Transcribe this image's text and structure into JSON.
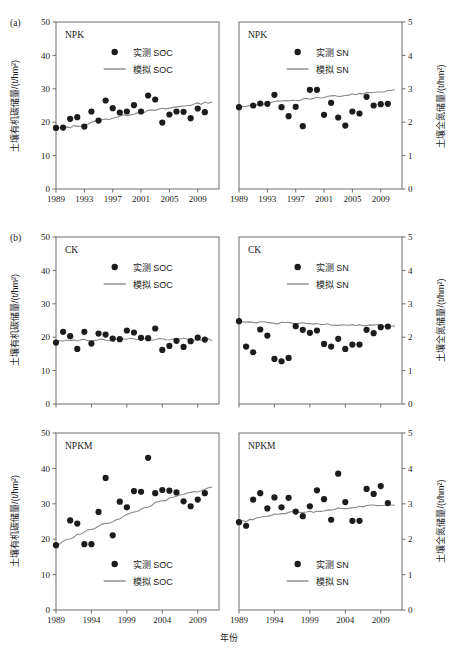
{
  "figure": {
    "corner_tags": [
      "(a)",
      "(b)"
    ],
    "xlabel": "年份",
    "ylabel_left": "土壤有机碳储量/(t/hm²)",
    "ylabel_right": "土壤全氮储量/(t/hm²)",
    "legend_measured_soc": "实测 SOC",
    "legend_simulated_soc": "模拟 SOC",
    "legend_measured_sn": "实测 SN",
    "legend_simulated_sn": "模拟 SN",
    "marker_color": "#1c1c1c",
    "line_color": "#8a8a8a",
    "axis_color": "#6d6d6d"
  },
  "chart_data": [
    {
      "type": "scatter",
      "panel": "a-left",
      "title": "NPK",
      "xlabel": "年份",
      "ylabel": "土壤有机碳储量/(t/hm²)",
      "xlim": [
        1989,
        2012
      ],
      "ylim": [
        0,
        50
      ],
      "yticks": [
        0,
        10,
        20,
        30,
        40,
        50
      ],
      "xticks": [
        1989,
        1993,
        1997,
        2001,
        2005,
        2009
      ],
      "grid": false,
      "legend_position": "top-center",
      "series": [
        {
          "name": "实测 SOC",
          "type": "scatter",
          "x": [
            1989,
            1990,
            1991,
            1992,
            1993,
            1994,
            1995,
            1996,
            1997,
            1998,
            1999,
            2000,
            2001,
            2002,
            2003,
            2004,
            2005,
            2006,
            2007,
            2008,
            2009,
            2010
          ],
          "values": [
            18.3,
            18.4,
            21.0,
            21.5,
            18.7,
            23.2,
            20.5,
            26.5,
            24.2,
            22.9,
            23.2,
            25.1,
            23.2,
            28.0,
            26.8,
            19.9,
            22.3,
            23.2,
            23.1,
            21.2,
            24.1,
            23.0
          ]
        },
        {
          "name": "模拟 SOC",
          "type": "line",
          "x": [
            1989,
            1991,
            1993,
            1995,
            1997,
            1999,
            2001,
            2003,
            2005,
            2007,
            2009,
            2011
          ],
          "values": [
            18.2,
            18.6,
            19.2,
            20.4,
            21.3,
            22.2,
            23.0,
            23.6,
            24.2,
            24.9,
            25.5,
            26.1
          ]
        }
      ]
    },
    {
      "type": "scatter",
      "panel": "a-right",
      "title": "NPK",
      "xlabel": "年份",
      "ylabel": "土壤全氮储量/(t/hm²)",
      "xlim": [
        1989,
        2012
      ],
      "ylim": [
        0,
        5
      ],
      "yticks": [
        0,
        1,
        2,
        3,
        4,
        5
      ],
      "xticks": [
        1989,
        1993,
        1997,
        2001,
        2005,
        2009
      ],
      "grid": false,
      "legend_position": "top-center",
      "series": [
        {
          "name": "实测 SN",
          "type": "scatter",
          "x": [
            1989,
            1991,
            1992,
            1993,
            1994,
            1995,
            1996,
            1997,
            1998,
            1999,
            2000,
            2001,
            2002,
            2003,
            2004,
            2005,
            2006,
            2007,
            2008,
            2009,
            2010
          ],
          "values": [
            2.45,
            2.5,
            2.56,
            2.55,
            2.82,
            2.45,
            2.18,
            2.46,
            1.88,
            2.97,
            2.97,
            2.22,
            2.58,
            2.14,
            1.9,
            2.32,
            2.26,
            2.76,
            2.5,
            2.54,
            2.55
          ]
        },
        {
          "name": "模拟 SN",
          "type": "line",
          "x": [
            1989,
            1991,
            1993,
            1995,
            1997,
            1999,
            2001,
            2003,
            2005,
            2007,
            2009,
            2011
          ],
          "values": [
            2.48,
            2.5,
            2.56,
            2.62,
            2.66,
            2.7,
            2.74,
            2.78,
            2.83,
            2.88,
            2.92,
            2.96
          ]
        }
      ]
    },
    {
      "type": "scatter",
      "panel": "b-top-left",
      "title": "CK",
      "xlabel": "年份",
      "ylabel": "土壤有机碳储量/(t/hm²)",
      "xlim": [
        1989,
        2012
      ],
      "ylim": [
        0,
        50
      ],
      "yticks": [
        0,
        10,
        20,
        30,
        40,
        50
      ],
      "xticks": [
        1989,
        1994,
        1999,
        2004,
        2009
      ],
      "grid": false,
      "legend_position": "top-center",
      "series": [
        {
          "name": "实测 SOC",
          "type": "scatter",
          "x": [
            1989,
            1990,
            1991,
            1992,
            1993,
            1994,
            1995,
            1996,
            1997,
            1998,
            1999,
            2000,
            2001,
            2002,
            2003,
            2004,
            2005,
            2006,
            2007,
            2008,
            2009,
            2010
          ],
          "values": [
            18.4,
            21.6,
            20.3,
            16.5,
            21.6,
            18.1,
            21.1,
            20.8,
            19.6,
            19.4,
            22.0,
            21.4,
            19.8,
            19.7,
            22.6,
            16.2,
            17.4,
            18.9,
            17.1,
            18.8,
            19.9,
            19.3
          ]
        },
        {
          "name": "模拟 SOC",
          "type": "line",
          "x": [
            1989,
            1991,
            1993,
            1995,
            1997,
            1999,
            2001,
            2003,
            2005,
            2007,
            2009,
            2011
          ],
          "values": [
            18.6,
            19.2,
            19.1,
            19.3,
            19.2,
            19.4,
            19.3,
            19.4,
            19.3,
            19.4,
            19.3,
            19.3
          ]
        }
      ]
    },
    {
      "type": "scatter",
      "panel": "b-top-right",
      "title": "CK",
      "xlabel": "年份",
      "ylabel": "土壤全氮储量/(t/hm²)",
      "xlim": [
        1989,
        2012
      ],
      "ylim": [
        0,
        5
      ],
      "yticks": [
        0,
        1,
        2,
        3,
        4,
        5
      ],
      "xticks": [
        1989,
        1994,
        1999,
        2004,
        2009
      ],
      "grid": false,
      "legend_position": "top-center",
      "series": [
        {
          "name": "实测 SN",
          "type": "scatter",
          "x": [
            1989,
            1990,
            1991,
            1992,
            1993,
            1994,
            1995,
            1996,
            1997,
            1998,
            1999,
            2000,
            2001,
            2002,
            2003,
            2004,
            2005,
            2006,
            2007,
            2008,
            2009,
            2010
          ],
          "values": [
            2.48,
            1.72,
            1.55,
            2.23,
            2.05,
            1.35,
            1.28,
            1.38,
            2.33,
            2.22,
            2.13,
            2.2,
            1.8,
            1.72,
            1.95,
            1.65,
            1.78,
            1.78,
            2.22,
            2.12,
            2.3,
            2.32
          ]
        },
        {
          "name": "模拟 SN",
          "type": "line",
          "x": [
            1989,
            1991,
            1993,
            1995,
            1997,
            1999,
            2001,
            2003,
            2005,
            2007,
            2009,
            2011
          ],
          "values": [
            2.45,
            2.44,
            2.43,
            2.42,
            2.41,
            2.4,
            2.39,
            2.38,
            2.37,
            2.36,
            2.35,
            2.34
          ]
        }
      ]
    },
    {
      "type": "scatter",
      "panel": "b-bottom-left",
      "title": "NPKM",
      "xlabel": "年份",
      "ylabel": "土壤有机碳储量/(t/hm²)",
      "xlim": [
        1989,
        2012
      ],
      "ylim": [
        0,
        50
      ],
      "yticks": [
        0,
        10,
        20,
        30,
        40,
        50
      ],
      "xticks": [
        1989,
        1994,
        1999,
        2004,
        2009
      ],
      "grid": false,
      "legend_position": "bottom-center",
      "series": [
        {
          "name": "实测 SOC",
          "type": "scatter",
          "x": [
            1989,
            1991,
            1992,
            1993,
            1994,
            1995,
            1996,
            1997,
            1998,
            1999,
            2000,
            2001,
            2002,
            2003,
            2004,
            2005,
            2006,
            2007,
            2008,
            2009,
            2010
          ],
          "values": [
            18.3,
            25.3,
            24.4,
            18.6,
            18.6,
            27.7,
            37.3,
            21.1,
            30.6,
            29.0,
            33.6,
            33.4,
            43.0,
            33.0,
            33.9,
            33.7,
            33.2,
            30.7,
            29.3,
            31.2,
            33.0
          ]
        },
        {
          "name": "模拟 SOC",
          "type": "line",
          "x": [
            1989,
            1991,
            1993,
            1995,
            1997,
            1999,
            2001,
            2003,
            2005,
            2007,
            2009,
            2011
          ],
          "values": [
            18.2,
            20.3,
            22.0,
            23.6,
            25.1,
            26.8,
            28.4,
            30.1,
            31.4,
            32.6,
            33.6,
            34.6
          ]
        }
      ]
    },
    {
      "type": "scatter",
      "panel": "b-bottom-right",
      "title": "NPKM",
      "xlabel": "年份",
      "ylabel": "土壤全氮储量/(t/hm²)",
      "xlim": [
        1989,
        2012
      ],
      "ylim": [
        0,
        5
      ],
      "yticks": [
        0,
        1,
        2,
        3,
        4,
        5
      ],
      "xticks": [
        1989,
        1994,
        1999,
        2004,
        2009
      ],
      "grid": false,
      "legend_position": "bottom-center",
      "series": [
        {
          "name": "实测 SN",
          "type": "scatter",
          "x": [
            1989,
            1990,
            1991,
            1992,
            1993,
            1994,
            1995,
            1996,
            1997,
            1998,
            1999,
            2000,
            2001,
            2002,
            2003,
            2004,
            2005,
            2006,
            2007,
            2008,
            2009,
            2010
          ],
          "values": [
            2.48,
            2.38,
            3.12,
            3.3,
            2.87,
            3.18,
            2.9,
            3.17,
            2.78,
            2.65,
            2.93,
            3.38,
            3.13,
            2.55,
            3.85,
            3.05,
            2.52,
            2.52,
            3.42,
            3.28,
            3.5,
            3.02
          ]
        },
        {
          "name": "模拟 SN",
          "type": "line",
          "x": [
            1989,
            1991,
            1993,
            1995,
            1997,
            1999,
            2001,
            2003,
            2005,
            2007,
            2009,
            2011
          ],
          "values": [
            2.48,
            2.55,
            2.66,
            2.74,
            2.78,
            2.76,
            2.82,
            2.86,
            2.9,
            2.93,
            2.96,
            2.99
          ]
        }
      ]
    }
  ]
}
